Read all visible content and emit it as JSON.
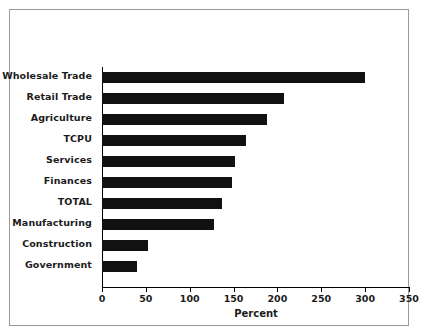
{
  "chart_data": {
    "type": "bar",
    "orientation": "horizontal",
    "title": "",
    "subtitle": "",
    "xlabel": "Percent",
    "ylabel": "",
    "xlim": [
      0,
      350
    ],
    "xticks": [
      0,
      50,
      100,
      150,
      200,
      250,
      300,
      350
    ],
    "xticklabels": [
      "0",
      "50",
      "100",
      "150",
      "200",
      "250",
      "300",
      "350"
    ],
    "grid": false,
    "legend": null,
    "bar_color": "#111111",
    "categories": [
      "Wholesale Trade",
      "Retail Trade",
      "Agriculture",
      "TCPU",
      "Services",
      "Finances",
      "TOTAL",
      "Manufacturing",
      "Construction",
      "Government"
    ],
    "values": [
      300,
      208,
      188,
      164,
      152,
      148,
      137,
      128,
      52,
      40
    ],
    "series": [
      {
        "name": "Percent",
        "values": [
          300,
          208,
          188,
          164,
          152,
          148,
          137,
          128,
          52,
          40
        ]
      }
    ],
    "annotations": []
  },
  "figure": {
    "border_color": "#9a9a9a",
    "background": "#ffffff"
  }
}
